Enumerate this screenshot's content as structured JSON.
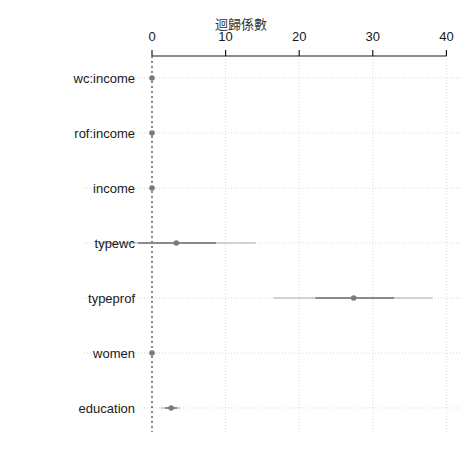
{
  "chart_data": {
    "type": "coefficient_plot",
    "title": "",
    "xlabel": "迴歸係數",
    "ylabel": "",
    "xlim": [
      -7.5,
      40
    ],
    "x_ticks": [
      0,
      10,
      20,
      30,
      40
    ],
    "x_tick_labels": [
      "0",
      "10",
      "20",
      "30",
      "40"
    ],
    "axis_position": "top",
    "reference_line": {
      "x": 0,
      "style": "dotted"
    },
    "grid": true,
    "categories": [
      "wc:income",
      "rof:income",
      "income",
      "typewc",
      "typeprof",
      "women",
      "education"
    ],
    "series": [
      {
        "name": "estimate",
        "values": [
          0.0,
          0.0,
          0.0,
          3.3,
          27.4,
          0.0,
          2.6
        ]
      },
      {
        "name": "inner_low",
        "values": [
          0.0,
          0.0,
          0.0,
          -1.9,
          22.2,
          -0.05,
          1.8
        ]
      },
      {
        "name": "inner_high",
        "values": [
          0.0,
          0.0,
          0.0,
          8.7,
          32.9,
          0.05,
          3.4
        ]
      },
      {
        "name": "outer_low",
        "values": [
          -0.05,
          -0.05,
          -0.05,
          -7.3,
          16.5,
          -0.1,
          1.2
        ]
      },
      {
        "name": "outer_high",
        "values": [
          0.05,
          0.05,
          0.05,
          14.1,
          38.1,
          0.1,
          3.8
        ]
      }
    ],
    "colors": {
      "point": "#7a7a7a",
      "interval": "#8a8a8a",
      "axis": "#1a1a1a",
      "grid": "#d9d9d9",
      "zero_line": "#555555"
    }
  }
}
